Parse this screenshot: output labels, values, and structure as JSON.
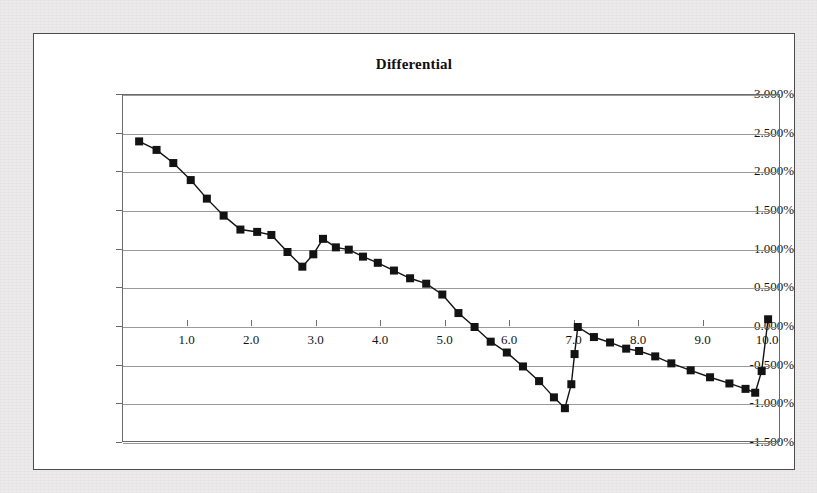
{
  "chart_data": {
    "type": "line",
    "title": "Differential",
    "xlabel": "",
    "ylabel": "",
    "xlim": [
      0,
      10.2
    ],
    "ylim": [
      -0.015,
      0.03
    ],
    "grid": true,
    "legend": "none",
    "marker": "square",
    "y_tick_labels": [
      "3.000%",
      "2.500%",
      "2.000%",
      "1.500%",
      "1.000%",
      "0.500%",
      "0.000%",
      "-0.500%",
      "-1.000%",
      "-1.500%"
    ],
    "y_tick_values": [
      0.03,
      0.025,
      0.02,
      0.015,
      0.01,
      0.005,
      0.0,
      -0.005,
      -0.01,
      -0.015
    ],
    "x_tick_labels": [
      "1.0",
      "2.0",
      "3.0",
      "4.0",
      "5.0",
      "6.0",
      "7.0",
      "8.0",
      "9.0",
      "10.0"
    ],
    "x_tick_values": [
      1,
      2,
      3,
      4,
      5,
      6,
      7,
      8,
      9,
      10
    ],
    "series": [
      {
        "name": "Differential",
        "x": [
          0.25,
          0.52,
          0.78,
          1.05,
          1.3,
          1.56,
          1.82,
          2.08,
          2.3,
          2.55,
          2.78,
          2.95,
          3.1,
          3.3,
          3.5,
          3.72,
          3.95,
          4.2,
          4.45,
          4.7,
          4.95,
          5.2,
          5.45,
          5.7,
          5.95,
          6.2,
          6.45,
          6.68,
          6.85,
          6.95,
          7.0,
          7.05,
          7.3,
          7.55,
          7.8,
          8.0,
          8.25,
          8.5,
          8.8,
          9.1,
          9.4,
          9.65,
          9.8,
          9.9,
          10.0
        ],
        "y": [
          0.024,
          0.0229,
          0.0212,
          0.019,
          0.0166,
          0.0144,
          0.0126,
          0.0123,
          0.0119,
          0.0097,
          0.0078,
          0.0094,
          0.0114,
          0.0103,
          0.01,
          0.0091,
          0.0083,
          0.0073,
          0.0063,
          0.0056,
          0.0042,
          0.0018,
          0.0,
          -0.0019,
          -0.0033,
          -0.0051,
          -0.007,
          -0.0091,
          -0.0105,
          -0.0074,
          -0.0035,
          0.0,
          -0.0013,
          -0.002,
          -0.0028,
          -0.0031,
          -0.0038,
          -0.0047,
          -0.0056,
          -0.0065,
          -0.0073,
          -0.008,
          -0.0085,
          -0.0057,
          0.001
        ]
      }
    ]
  }
}
